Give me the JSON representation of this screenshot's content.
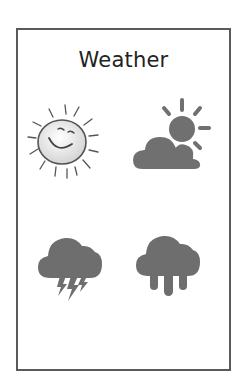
{
  "card": {
    "title": "Weather"
  },
  "icons": [
    {
      "name": "sunny",
      "label": "Sunny",
      "style": "hand-drawn smiling sun"
    },
    {
      "name": "partly-cloudy",
      "label": "Partly Cloudy",
      "style": "sun behind cloud"
    },
    {
      "name": "thunderstorm",
      "label": "Thunderstorm",
      "style": "cloud with lightning"
    },
    {
      "name": "rain",
      "label": "Rain",
      "style": "cloud with drops"
    }
  ],
  "colors": {
    "border": "#5a5a5a",
    "icon_fill": "#707070",
    "sketch_stroke": "#555555",
    "background": "#ffffff"
  }
}
